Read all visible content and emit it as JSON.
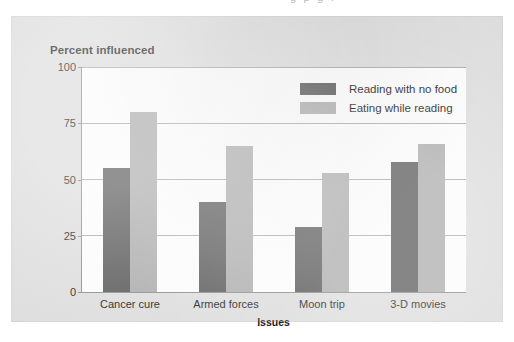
{
  "scan": {
    "top_sliver_text": "g  p  g  ."
  },
  "chart_data": {
    "type": "bar",
    "title": "Percent influenced",
    "xlabel": "Issues",
    "ylabel": "Percent influenced",
    "categories": [
      "Cancer cure",
      "Armed forces",
      "Moon trip",
      "3-D movies"
    ],
    "series": [
      {
        "name": "Reading with no food",
        "color": "#575757",
        "values": [
          55,
          40,
          29,
          58
        ]
      },
      {
        "name": "Eating while reading",
        "color": "#ababab",
        "values": [
          80,
          65,
          53,
          66
        ]
      }
    ],
    "ylim": [
      0,
      100
    ],
    "yticks": [
      0,
      25,
      50,
      75,
      100
    ],
    "ytick_labels": [
      "0",
      "25",
      "50",
      "75",
      "100"
    ],
    "grid": true,
    "legend_position": "top-right-inside"
  }
}
